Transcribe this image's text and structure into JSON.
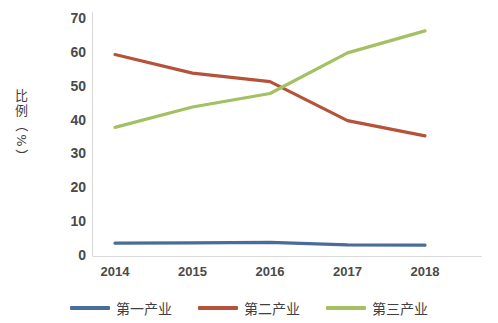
{
  "chart_data": {
    "type": "line",
    "title": "",
    "xlabel": "",
    "ylabel": "比例（%）",
    "categories": [
      "2014",
      "2015",
      "2016",
      "2017",
      "2018"
    ],
    "ylim": [
      0,
      70
    ],
    "yticks": [
      "0",
      "10",
      "20",
      "30",
      "40",
      "50",
      "60",
      "70"
    ],
    "grid": false,
    "legend_position": "bottom",
    "series": [
      {
        "name": "第一产业",
        "color": "#4a6c9b",
        "values": [
          3.8,
          3.9,
          4.0,
          3.3,
          3.2
        ]
      },
      {
        "name": "第二产业",
        "color": "#b5533a",
        "values": [
          59.5,
          54.0,
          51.5,
          40.0,
          35.5
        ]
      },
      {
        "name": "第三产业",
        "color": "#a3c062",
        "values": [
          38.0,
          44.0,
          48.0,
          60.0,
          66.5
        ]
      }
    ]
  },
  "axis": {
    "y_title_chars": [
      "比",
      "例"
    ],
    "y_title_open_paren": "（",
    "y_title_percent": "%",
    "y_title_close_paren": "）"
  }
}
